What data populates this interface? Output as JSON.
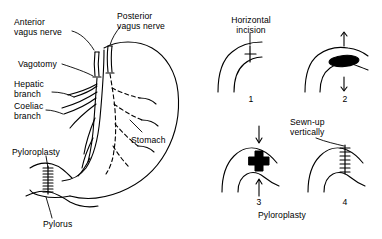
{
  "figure": {
    "ink_color": "#000000",
    "background_color": "#ffffff"
  },
  "anatomy_panel": {
    "name": "stomach-vagotomy-diagram",
    "labels": {
      "anterior_vagus_nerve": "Anterior\nvagus nerve",
      "posterior_vagus_nerve": "Posterior\nvagus nerve",
      "vagotomy": "Vagotomy",
      "hepatic_branch": "Hepatic\nbranch",
      "coeliac_branch": "Coeliac\nbranch",
      "stomach": "Stomach",
      "pyloroplasty": "Pyloroplasty",
      "pylorus": "Pylorus"
    }
  },
  "procedure_panels": {
    "caption": "Pyloroplasty",
    "steps": [
      {
        "number": "1",
        "label": "Horizontal\nincision",
        "description": "horizontal-incision-mark"
      },
      {
        "number": "2",
        "label": "",
        "description": "opened-incision-ellipse-with-arrows"
      },
      {
        "number": "3",
        "label": "",
        "description": "cross-shaped-opening-with-arrows"
      },
      {
        "number": "4",
        "label": "Sewn-up\nvertically",
        "description": "vertical-suture-line"
      }
    ]
  }
}
